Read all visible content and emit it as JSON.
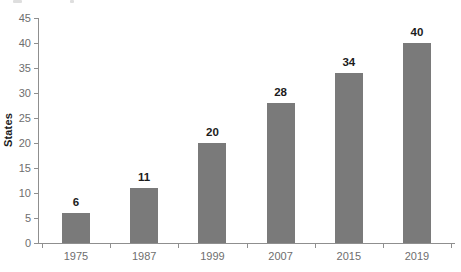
{
  "figure": {
    "y_axis_title": "States"
  },
  "chart_data": {
    "type": "bar",
    "title": "",
    "categories": [
      "1975",
      "1987",
      "1999",
      "2007",
      "2015",
      "2019"
    ],
    "values": [
      6,
      11,
      20,
      28,
      34,
      40
    ],
    "xlabel": "",
    "ylabel": "States",
    "ylim": [
      0,
      45
    ],
    "ytick_step": 5,
    "yticks": [
      0,
      5,
      10,
      15,
      20,
      25,
      30,
      35,
      40,
      45
    ],
    "grid": false,
    "legend": "none",
    "data_labels": "above-bars",
    "bar_color": "#7a7a7a",
    "axis_color": "#8f8f8f",
    "tick_label_color": "#6e6e6e",
    "value_label_color": "#1c1c1c"
  }
}
